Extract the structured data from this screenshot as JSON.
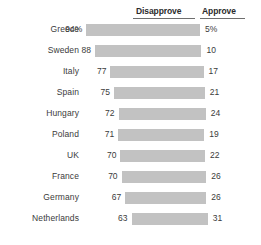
{
  "chart_data": {
    "type": "bar",
    "title": "",
    "subtitle": "",
    "xlabel": "",
    "ylabel": "",
    "grid": false,
    "legend_position": "top",
    "orientation": "horizontal",
    "value_suffix": "%",
    "columns": [
      "Disapprove",
      "Approve"
    ],
    "categories": [
      "Greece",
      "Sweden",
      "Italy",
      "Spain",
      "Hungary",
      "Poland",
      "UK",
      "France",
      "Germany",
      "Netherlands"
    ],
    "series": [
      {
        "name": "Disapprove",
        "values": [
          94,
          88,
          77,
          75,
          72,
          71,
          70,
          70,
          67,
          63
        ]
      },
      {
        "name": "Approve",
        "values": [
          5,
          10,
          17,
          21,
          24,
          19,
          22,
          26,
          26,
          31
        ]
      }
    ],
    "labels": {
      "disapprove": [
        "94%",
        "88",
        "77",
        "75",
        "72",
        "71",
        "70",
        "70",
        "67",
        "63"
      ],
      "approve": [
        "5%",
        "10",
        "17",
        "21",
        "24",
        "19",
        "22",
        "26",
        "26",
        "31"
      ]
    },
    "colors": {
      "bar": "#c2c2c2",
      "text": "#3b3b3b",
      "header_text": "#2b2b2b",
      "rule": "#6e6e6e",
      "background": "#ffffff"
    }
  },
  "header": {
    "disapprove_label": "Disapprove",
    "approve_label": "Approve"
  },
  "rows": [
    {
      "country": "Greece",
      "disapprove": "94%",
      "approve": "5%",
      "dis_value": 94,
      "app_value": 5
    },
    {
      "country": "Sweden",
      "disapprove": "88",
      "approve": "10",
      "dis_value": 88,
      "app_value": 10
    },
    {
      "country": "Italy",
      "disapprove": "77",
      "approve": "17",
      "dis_value": 77,
      "app_value": 17
    },
    {
      "country": "Spain",
      "disapprove": "75",
      "approve": "21",
      "dis_value": 75,
      "app_value": 21
    },
    {
      "country": "Hungary",
      "disapprove": "72",
      "approve": "24",
      "dis_value": 72,
      "app_value": 24
    },
    {
      "country": "Poland",
      "disapprove": "71",
      "approve": "19",
      "dis_value": 71,
      "app_value": 19
    },
    {
      "country": "UK",
      "disapprove": "70",
      "approve": "22",
      "dis_value": 70,
      "app_value": 22
    },
    {
      "country": "France",
      "disapprove": "70",
      "approve": "26",
      "dis_value": 70,
      "app_value": 26
    },
    {
      "country": "Germany",
      "disapprove": "67",
      "approve": "26",
      "dis_value": 67,
      "app_value": 26
    },
    {
      "country": "Netherlands",
      "disapprove": "63",
      "approve": "31",
      "dis_value": 63,
      "app_value": 31
    }
  ]
}
